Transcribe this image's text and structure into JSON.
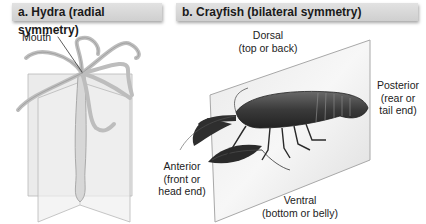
{
  "panel_a": {
    "title": "a. Hydra (radial symmetry)",
    "labels": {
      "mouth": "Mouth"
    }
  },
  "panel_b": {
    "title": "b. Crayfish (bilateral symmetry)",
    "labels": {
      "dorsal": "Dorsal",
      "dorsal_desc": "(top or back)",
      "posterior": "Posterior",
      "posterior_desc1": "(rear or",
      "posterior_desc2": "tail end)",
      "anterior": "Anterior",
      "anterior_desc1": "(front or",
      "anterior_desc2": "head end)",
      "ventral": "Ventral",
      "ventral_desc": "(bottom or belly)"
    }
  },
  "colors": {
    "header_bg": "#d8d8d8",
    "plane": "#e6e6e6",
    "animal_dark": "#3a3a3a",
    "hydra": "#cfcfcf"
  }
}
